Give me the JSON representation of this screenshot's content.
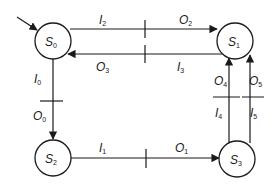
{
  "diagram": {
    "type": "state-transition-diagram",
    "initial_state": "S0",
    "states": [
      {
        "id": "S0",
        "base": "S",
        "sub": "0"
      },
      {
        "id": "S1",
        "base": "S",
        "sub": "1"
      },
      {
        "id": "S2",
        "base": "S",
        "sub": "2"
      },
      {
        "id": "S3",
        "base": "S",
        "sub": "3"
      }
    ],
    "transitions": [
      {
        "from": "S0",
        "to": "S1",
        "input": {
          "base": "I",
          "sub": "2"
        },
        "output": {
          "base": "O",
          "sub": "2"
        }
      },
      {
        "from": "S1",
        "to": "S0",
        "input": {
          "base": "I",
          "sub": "3"
        },
        "output": {
          "base": "O",
          "sub": "3"
        }
      },
      {
        "from": "S0",
        "to": "S2",
        "input": {
          "base": "I",
          "sub": "0"
        },
        "output": {
          "base": "O",
          "sub": "0"
        }
      },
      {
        "from": "S2",
        "to": "S3",
        "input": {
          "base": "I",
          "sub": "1"
        },
        "output": {
          "base": "O",
          "sub": "1"
        }
      },
      {
        "from": "S3",
        "to": "S1",
        "input": {
          "base": "I",
          "sub": "4"
        },
        "output": {
          "base": "O",
          "sub": "4"
        }
      },
      {
        "from": "S3",
        "to": "S1",
        "input": {
          "base": "I",
          "sub": "5"
        },
        "output": {
          "base": "O",
          "sub": "5"
        }
      }
    ]
  }
}
